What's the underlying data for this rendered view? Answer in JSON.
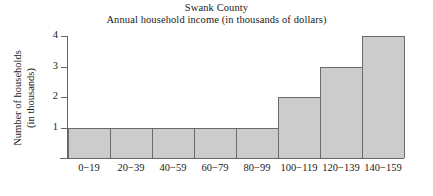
{
  "chart_data": {
    "type": "bar",
    "title": "Swank County",
    "subtitle": "Annual household income (in thousands of dollars)",
    "xlabel": "",
    "ylabel": "Number of households",
    "ylabel_line2": "(in thousands)",
    "categories": [
      "0−19",
      "20−39",
      "40−59",
      "60−79",
      "80−99",
      "100−119",
      "120−139",
      "140−159"
    ],
    "values": [
      1,
      1,
      1,
      1,
      1,
      2,
      3,
      4
    ],
    "ylim": [
      0,
      4
    ],
    "ytick_labels": [
      "1",
      "2",
      "3",
      "4"
    ],
    "ytick_values": [
      1,
      2,
      3,
      4
    ],
    "grid": false,
    "legend": "none",
    "bar_fill_color": "#cccccc",
    "bar_border_color": "#6b6b6b",
    "axis_color": "#666666",
    "background_color": "#ffffff",
    "text_color": "#1a1a1a"
  }
}
